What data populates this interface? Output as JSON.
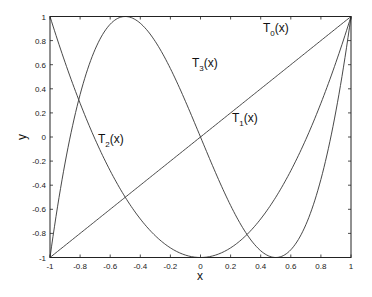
{
  "chart_data": {
    "type": "line",
    "title": "",
    "xlabel": "x",
    "ylabel": "y",
    "xlim": [
      -1,
      1
    ],
    "ylim": [
      -1,
      1
    ],
    "grid": false,
    "legend": "none (inline curve labels)",
    "xticks": [
      -1,
      -0.8,
      -0.6,
      -0.4,
      -0.2,
      0,
      0.2,
      0.4,
      0.6,
      0.8,
      1
    ],
    "xtick_labels": [
      "-1",
      "-0.8",
      "-0.6",
      "-0.4",
      "-0.2",
      "0",
      "0.2",
      "0.4",
      "0.6",
      "0.8",
      "1"
    ],
    "yticks": [
      -1,
      -0.8,
      -0.6,
      -0.4,
      -0.2,
      0,
      0.2,
      0.4,
      0.6,
      0.8,
      1
    ],
    "ytick_labels": [
      "-1",
      "-0.8",
      "-0.6",
      "-0.4",
      "-0.2",
      "0",
      "0.2",
      "0.4",
      "0.6",
      "0.8",
      "1"
    ],
    "series": [
      {
        "name": "T0(x)",
        "formula": "1",
        "x": [
          -1,
          1
        ],
        "values": [
          1,
          1
        ]
      },
      {
        "name": "T1(x)",
        "formula": "x",
        "x": [
          -1,
          1
        ],
        "values": [
          -1,
          1
        ]
      },
      {
        "name": "T2(x)",
        "formula": "2x^2-1",
        "x": [
          -1,
          -0.8,
          -0.6,
          -0.4,
          -0.2,
          0,
          0.2,
          0.4,
          0.6,
          0.8,
          1
        ],
        "values": [
          1,
          0.28,
          -0.28,
          -0.68,
          -0.92,
          -1,
          -0.92,
          -0.68,
          -0.28,
          0.28,
          1
        ]
      },
      {
        "name": "T3(x)",
        "formula": "4x^3-3x",
        "x": [
          -1,
          -0.8,
          -0.6,
          -0.5,
          -0.4,
          -0.2,
          0,
          0.2,
          0.4,
          0.5,
          0.6,
          0.8,
          1
        ],
        "values": [
          -1,
          0.352,
          0.936,
          1,
          0.944,
          0.568,
          0,
          -0.568,
          -0.944,
          -1,
          -0.936,
          -0.352,
          1
        ]
      }
    ],
    "annotations": [
      {
        "text": "T",
        "sub": "0",
        "suffix": "(x)",
        "x": 0.42,
        "y": 0.9
      },
      {
        "text": "T",
        "sub": "3",
        "suffix": "(x)",
        "x": -0.23,
        "y": 0.6
      },
      {
        "text": "T",
        "sub": "2",
        "suffix": "(x)",
        "x": -0.72,
        "y": -0.07
      },
      {
        "text": "T",
        "sub": "1",
        "suffix": "(x)",
        "x": 0.27,
        "y": 0.1
      }
    ]
  },
  "labels": {
    "xlabel": "x",
    "ylabel": "y",
    "t0": {
      "main": "T",
      "sub": "0",
      "suffix": "(x)"
    },
    "t1": {
      "main": "T",
      "sub": "1",
      "suffix": "(x)"
    },
    "t2": {
      "main": "T",
      "sub": "2",
      "suffix": "(x)"
    },
    "t3": {
      "main": "T",
      "sub": "3",
      "suffix": "(x)"
    }
  },
  "style": {
    "line_color": "#333333",
    "frame_color": "#222222"
  }
}
